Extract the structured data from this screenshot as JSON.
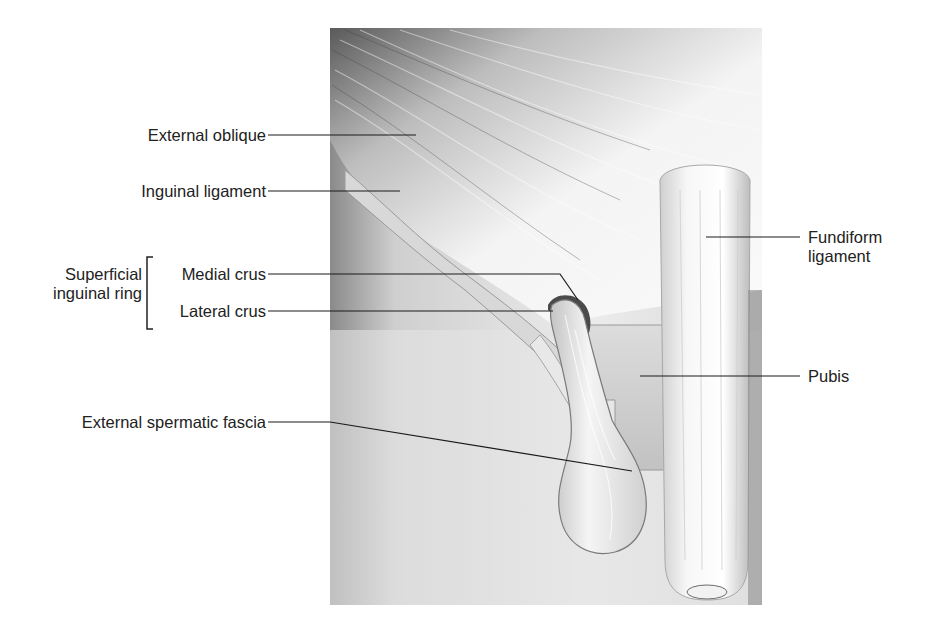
{
  "figure": {
    "labels": {
      "external_oblique": "External oblique",
      "inguinal_ligament": "Inguinal ligament",
      "superficial_inguinal_ring_line1": "Superficial",
      "superficial_inguinal_ring_line2": "inguinal ring",
      "medial_crus": "Medial crus",
      "lateral_crus": "Lateral crus",
      "external_spermatic_fascia": "External spermatic fascia",
      "fundiform_ligament_line1": "Fundiform",
      "fundiform_ligament_line2": "ligament",
      "pubis": "Pubis"
    },
    "colors": {
      "background": "#ffffff",
      "text": "#222222",
      "leader_line": "#1a1a1a",
      "shadow_gray": "#8c8c8c",
      "light_gray": "#e6e6e6"
    }
  }
}
